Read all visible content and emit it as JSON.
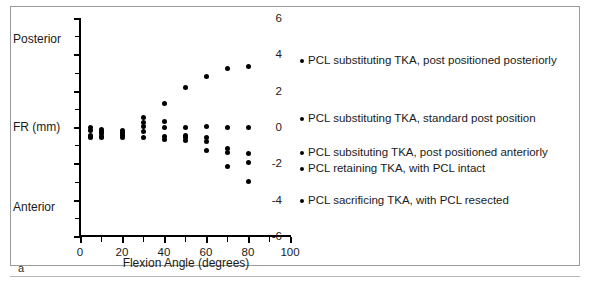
{
  "figure": {
    "panel_letter": "a"
  },
  "chart_data": {
    "type": "scatter",
    "title": "",
    "xlabel": "Flexion Angle (degrees)",
    "ylabel": "FR (mm)",
    "ylabel_top": "Posterior",
    "ylabel_bottom": "Anterior",
    "xlim": [
      0,
      100
    ],
    "ylim": [
      -6,
      6
    ],
    "xticks": [
      0,
      20,
      40,
      60,
      80,
      100
    ],
    "xtick_labels": [
      "0",
      "20",
      "40",
      "60",
      "80",
      "100"
    ],
    "xminorticks": [
      10,
      30,
      50,
      70,
      90
    ],
    "yticks": [
      -6,
      -4,
      -2,
      0,
      2,
      4,
      6
    ],
    "ytick_labels": [
      "-6",
      "-4",
      "-2",
      "0",
      "2",
      "4",
      "6"
    ],
    "yminorticks": [
      -5,
      -3,
      -1,
      1,
      3,
      5
    ],
    "grid": false,
    "legend_position": "right",
    "marker_color": "#000000",
    "series": [
      {
        "name": "PCL substituting TKA, post positioned posteriorly",
        "points": [
          [
            5,
            -0.2
          ],
          [
            10,
            -0.15
          ],
          [
            20,
            -0.2
          ],
          [
            30,
            0.5
          ],
          [
            40,
            1.3
          ],
          [
            50,
            2.2
          ],
          [
            60,
            2.8
          ],
          [
            70,
            3.2
          ],
          [
            80,
            3.35
          ]
        ]
      },
      {
        "name": "PCL substituting TKA, standard post position",
        "points": [
          [
            5,
            -0.45
          ],
          [
            10,
            -0.35
          ],
          [
            20,
            -0.35
          ],
          [
            30,
            0.05
          ],
          [
            40,
            0.3
          ],
          [
            50,
            -0.05
          ],
          [
            60,
            0.05
          ],
          [
            70,
            0.0
          ],
          [
            80,
            0.0
          ]
        ]
      },
      {
        "name": "PCL subsituting TKA, post positioned anteriorly",
        "points": [
          [
            5,
            -0.6
          ],
          [
            10,
            -0.5
          ],
          [
            20,
            -0.45
          ],
          [
            30,
            -0.25
          ],
          [
            40,
            0.0
          ],
          [
            50,
            -0.45
          ],
          [
            60,
            -0.6
          ],
          [
            70,
            -1.2
          ],
          [
            80,
            -1.45
          ]
        ]
      },
      {
        "name": "PCL retaining TKA, with PCL intact",
        "points": [
          [
            5,
            -0.05
          ],
          [
            10,
            -0.6
          ],
          [
            20,
            -0.6
          ],
          [
            30,
            -0.6
          ],
          [
            40,
            -0.5
          ],
          [
            50,
            -0.6
          ],
          [
            60,
            -0.8
          ],
          [
            70,
            -1.4
          ],
          [
            80,
            -1.95
          ]
        ]
      },
      {
        "name": "PCL sacrificing TKA, with PCL resected",
        "points": [
          [
            5,
            -0.5
          ],
          [
            10,
            -0.25
          ],
          [
            20,
            -0.3
          ],
          [
            30,
            0.25
          ],
          [
            40,
            -0.7
          ],
          [
            50,
            -0.75
          ],
          [
            60,
            -1.3
          ],
          [
            70,
            -2.15
          ],
          [
            80,
            -3.0
          ]
        ]
      }
    ]
  }
}
